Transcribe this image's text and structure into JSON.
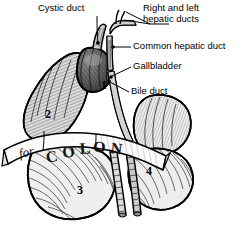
{
  "figure": {
    "kind": "anatomical-line-drawing",
    "background_color": "#ffffff",
    "ink_color": "#000000",
    "fill_light": "#e8e8e8",
    "fill_mid": "#c9c9c9",
    "fill_dark": "#9a9a9a"
  },
  "labels": [
    {
      "id": "cystic-duct",
      "text": "Cystic duct",
      "x": 38,
      "y": 5,
      "align": "left"
    },
    {
      "id": "hepatic-ducts",
      "text": "Right and left\n   hepatic ducts",
      "x": 143,
      "y": 5,
      "align": "left"
    },
    {
      "id": "common-hepatic-duct",
      "text": "Common hepatic duct",
      "x": 133,
      "y": 43,
      "align": "left"
    },
    {
      "id": "gallbladder",
      "text": "Gallbladder",
      "x": 133,
      "y": 63,
      "align": "left"
    },
    {
      "id": "bile-duct",
      "text": "Bile duct",
      "x": 131,
      "y": 88,
      "align": "left"
    }
  ],
  "markers": [
    {
      "id": "marker-1",
      "text": "1",
      "x": 101,
      "y": 85
    },
    {
      "id": "marker-2",
      "text": "2",
      "x": 45,
      "y": 114
    },
    {
      "id": "marker-3",
      "text": "3",
      "x": 77,
      "y": 190
    },
    {
      "id": "marker-4",
      "text": "4",
      "x": 146,
      "y": 171
    }
  ],
  "banner": {
    "id": "colon-ribbon",
    "small_text": "for",
    "big_text": [
      "C",
      "O",
      "L",
      "O",
      "N"
    ]
  }
}
